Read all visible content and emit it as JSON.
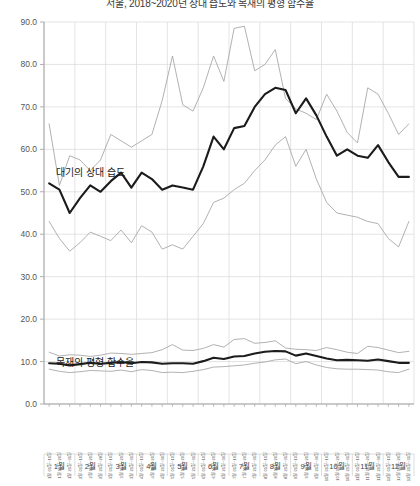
{
  "title": "서울, 2018~2020년 상대 습도와 목재의 평형 함수율",
  "annotations": {
    "humidity": "대기의 상대 습도",
    "emc": "목재의 평형 함수율"
  },
  "axis": {
    "y_ticks": [
      "0.0",
      "10.0",
      "20.0",
      "30.0",
      "40.0",
      "50.0",
      "60.0",
      "70.0",
      "80.0",
      "90.0"
    ],
    "y_min": 0,
    "y_max": 90,
    "y_step": 10,
    "grid": true
  },
  "months": [
    "1월",
    "2월",
    "3월",
    "4월",
    "5월",
    "6월",
    "7월",
    "8월",
    "9월",
    "10월",
    "11월",
    "12월"
  ],
  "period_labels": [
    "1월 01일~10일",
    "1월 11일~20일",
    "1월 21일~31일",
    "2월 01일~10일",
    "2월 11일~20일",
    "2월 21일~28일",
    "3월 01일~10일",
    "3월 11일~20일",
    "3월 21일~31일",
    "4월 01일~10일",
    "4월 11일~20일",
    "4월 21일~30일",
    "5월 01일~10일",
    "5월 11일~20일",
    "5월 21일~31일",
    "6월 01일~10일",
    "6월 11일~20일",
    "6월 21일~30일",
    "7월 01일~10일",
    "7월 11일~20일",
    "7월 21일~31일",
    "8월 01일~10일",
    "8월 11일~20일",
    "8월 21일~31일",
    "9월 01일~10일",
    "9월 11일~20일",
    "9월 21일~30일",
    "10월 01일~10일",
    "10월 11일~20일",
    "10월 21일~31일",
    "11월 01일~10일",
    "11월 11일~20일",
    "11월 21일~30일",
    "12월 01일~10일",
    "12월 11일~20일",
    "12월 21일~31일"
  ],
  "colors": {
    "mean_line": "#1a1a1a",
    "bound_line": "#a8a8a8",
    "grid": "#d9d9d9",
    "axis": "#9a9a9a",
    "text": "#3a3a3a"
  },
  "chart_data": {
    "type": "line",
    "title": "서울, 2018~2020년 상대 습도와 목재의 평형 함수율",
    "xlabel": "",
    "ylabel": "",
    "ylim": [
      0,
      90
    ],
    "grid": true,
    "legend": "none",
    "x": [
      "1월 01일~10일",
      "1월 11일~20일",
      "1월 21일~31일",
      "2월 01일~10일",
      "2월 11일~20일",
      "2월 21일~28일",
      "3월 01일~10일",
      "3월 11일~20일",
      "3월 21일~31일",
      "4월 01일~10일",
      "4월 11일~20일",
      "4월 21일~30일",
      "5월 01일~10일",
      "5월 11일~20일",
      "5월 21일~31일",
      "6월 01일~10일",
      "6월 11일~20일",
      "6월 21일~30일",
      "7월 01일~10일",
      "7월 11일~20일",
      "7월 21일~31일",
      "8월 01일~10일",
      "8월 11일~20일",
      "8월 21일~31일",
      "9월 01일~10일",
      "9월 11일~20일",
      "9월 21일~30일",
      "10월 01일~10일",
      "10월 11일~20일",
      "10월 21일~31일",
      "11월 01일~10일",
      "11월 11일~20일",
      "11월 21일~30일",
      "12월 01일~10일",
      "12월 11일~20일",
      "12월 21일~31일"
    ],
    "series": [
      {
        "name": "상대 습도 최대",
        "group": "humidity",
        "role": "upper",
        "values": [
          66.0,
          51.5,
          58.5,
          57.5,
          55.0,
          57.5,
          63.5,
          62.0,
          60.5,
          62.0,
          63.5,
          71.5,
          82.0,
          70.5,
          69.0,
          74.5,
          82.0,
          76.0,
          88.5,
          89.0,
          78.5,
          80.0,
          83.5,
          72.0,
          69.5,
          68.5,
          67.0,
          73.0,
          69.0,
          64.0,
          61.5,
          74.5,
          73.0,
          68.5,
          63.5,
          66.0
        ]
      },
      {
        "name": "상대 습도 평균",
        "group": "humidity",
        "role": "mean",
        "values": [
          52.0,
          50.5,
          45.0,
          48.5,
          51.5,
          50.0,
          52.5,
          54.5,
          51.0,
          54.5,
          53.0,
          50.5,
          51.5,
          51.0,
          50.5,
          56.0,
          63.0,
          60.0,
          65.0,
          65.5,
          70.0,
          73.0,
          74.5,
          74.0,
          68.5,
          72.0,
          68.0,
          63.0,
          58.5,
          60.0,
          58.5,
          58.0,
          61.0,
          57.0,
          53.5,
          53.5
        ]
      },
      {
        "name": "상대 습도 최소",
        "group": "humidity",
        "role": "lower",
        "values": [
          43.0,
          39.0,
          36.0,
          38.0,
          40.5,
          39.5,
          38.5,
          41.0,
          38.0,
          42.0,
          40.5,
          36.5,
          37.5,
          36.5,
          39.5,
          42.5,
          47.5,
          48.5,
          50.5,
          52.0,
          55.0,
          57.5,
          61.0,
          63.0,
          56.0,
          60.0,
          53.0,
          47.5,
          45.0,
          44.5,
          44.0,
          43.0,
          42.5,
          39.0,
          37.0,
          43.0
        ]
      },
      {
        "name": "평형 함수율 최대",
        "group": "emc",
        "role": "upper",
        "values": [
          12.2,
          11.3,
          11.6,
          11.5,
          11.2,
          11.5,
          12.0,
          11.9,
          11.7,
          11.9,
          12.1,
          12.8,
          14.0,
          12.7,
          12.6,
          13.1,
          14.0,
          13.4,
          15.2,
          15.4,
          14.3,
          14.5,
          14.9,
          13.2,
          12.9,
          12.8,
          12.6,
          13.3,
          12.8,
          12.2,
          11.9,
          13.6,
          13.3,
          12.7,
          12.1,
          12.4
        ]
      },
      {
        "name": "평형 함수율 평균",
        "group": "emc",
        "role": "mean",
        "values": [
          9.6,
          9.5,
          9.1,
          9.4,
          9.7,
          9.5,
          9.7,
          9.9,
          9.6,
          9.9,
          9.8,
          9.5,
          9.6,
          9.6,
          9.5,
          10.1,
          10.9,
          10.6,
          11.2,
          11.3,
          11.9,
          12.3,
          12.5,
          12.4,
          11.4,
          11.9,
          11.3,
          10.7,
          10.3,
          10.4,
          10.3,
          10.2,
          10.5,
          10.1,
          9.7,
          9.7
        ]
      },
      {
        "name": "평형 함수율 최소",
        "group": "emc",
        "role": "lower",
        "values": [
          8.2,
          7.7,
          7.4,
          7.6,
          7.9,
          7.8,
          7.7,
          8.0,
          7.6,
          8.1,
          7.9,
          7.4,
          7.5,
          7.4,
          7.7,
          8.1,
          8.7,
          8.8,
          9.0,
          9.2,
          9.6,
          9.9,
          10.4,
          10.6,
          9.5,
          10.0,
          9.2,
          8.6,
          8.3,
          8.2,
          8.2,
          8.1,
          8.0,
          7.6,
          7.4,
          8.2
        ]
      }
    ]
  }
}
